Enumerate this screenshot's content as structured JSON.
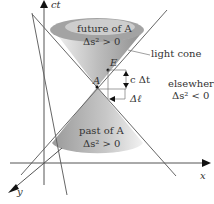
{
  "diagram": {
    "axes": {
      "t_label": "ct",
      "x_label": "x",
      "y_label": "y"
    },
    "future": {
      "line1": "future of A",
      "line2": "Δs² > 0"
    },
    "past": {
      "line1": "past of A",
      "line2": "Δs² > 0"
    },
    "light_cone": "light cone",
    "elsewhere": {
      "line1": "elsewhere",
      "line2": "Δs² < 0"
    },
    "event_A": "A",
    "event_E": "E",
    "c_dt": "c Δt",
    "d_ell": "Δℓ",
    "colors": {
      "cone_dark": "#8a8a8a",
      "cone_light": "#e8e8e8",
      "line": "#555555"
    }
  }
}
